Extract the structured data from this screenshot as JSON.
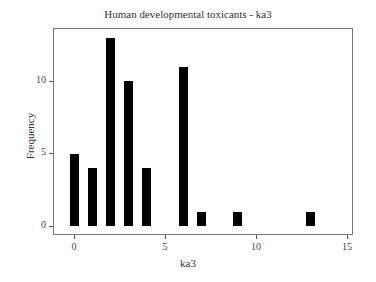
{
  "chart_data": {
    "type": "bar",
    "title": "Human developmental toxicants - ka3",
    "xlabel": "ka3",
    "ylabel": "Frequency",
    "x": [
      0,
      1,
      2,
      3,
      4,
      6,
      7,
      9,
      13
    ],
    "values": [
      5,
      4,
      13,
      10,
      4,
      11,
      1,
      1,
      1
    ],
    "xlim": [
      -1,
      15.3
    ],
    "ylim": [
      -0.7,
      13.5
    ],
    "xticks": [
      0,
      5,
      10,
      15
    ],
    "yticks": [
      0,
      5,
      10
    ],
    "grid": false,
    "legend": null,
    "bar_color": "#000000"
  },
  "labels": {
    "title": "Human developmental toxicants - ka3",
    "xlabel": "ka3",
    "ylabel": "Frequency",
    "xticks": [
      "0",
      "5",
      "10",
      "15"
    ],
    "yticks": [
      "0",
      "5",
      "10"
    ]
  }
}
